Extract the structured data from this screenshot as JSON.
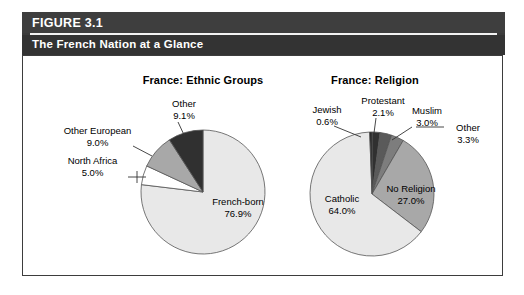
{
  "figure": {
    "number": "FIGURE 3.1",
    "subtitle": "The French Nation at a Glance"
  },
  "colors": {
    "header_bg": "#3b3b3b",
    "header_bg_bottom": "#333333",
    "header_text": "#ffffff",
    "border": "#3d3d3d",
    "slice_light": "#e8e8e8",
    "slice_white": "#ffffff",
    "slice_medium": "#a8a8a8",
    "slice_dark": "#303030",
    "slice_darker": "#1e1e1e",
    "slice_mid_dark": "#5a5a5a",
    "slice_mid": "#7d7d7d",
    "outline": "#555555"
  },
  "chart_data": [
    {
      "type": "pie",
      "title": "France: Ethnic Groups",
      "labels": [
        "French-born",
        "North Africa",
        "Other European",
        "Other"
      ],
      "values": [
        76.9,
        9.0,
        5.0,
        9.1
      ],
      "value_strings": [
        "76.9%",
        "5.0%",
        "9.0%",
        "9.1%"
      ],
      "slices": [
        {
          "label": "French-born",
          "value": 76.9,
          "value_str": "76.9%",
          "color": "#e8e8e8",
          "inside": true
        },
        {
          "label": "North Africa",
          "value": 5.0,
          "value_str": "5.0%",
          "color": "#ffffff",
          "inside": false
        },
        {
          "label": "Other European",
          "value": 9.0,
          "value_str": "9.0%",
          "color": "#a8a8a8",
          "inside": false
        },
        {
          "label": "Other",
          "value": 9.1,
          "value_str": "9.1%",
          "color": "#303030",
          "inside": false
        }
      ],
      "legend": "none",
      "grid": false
    },
    {
      "type": "pie",
      "title": "France: Religion",
      "labels": [
        "Catholic",
        "No Religion",
        "Other",
        "Muslim",
        "Protestant",
        "Jewish"
      ],
      "values": [
        64.0,
        27.0,
        3.3,
        3.0,
        2.1,
        0.6
      ],
      "value_strings": [
        "64.0%",
        "27.0%",
        "3.3%",
        "3.0%",
        "2.1%",
        "0.6%"
      ],
      "slices": [
        {
          "label": "Catholic",
          "value": 64.0,
          "value_str": "64.0%",
          "color": "#e8e8e8",
          "inside": true
        },
        {
          "label": "No Religion",
          "value": 27.0,
          "value_str": "27.0%",
          "color": "#a8a8a8",
          "inside": true
        },
        {
          "label": "Other",
          "value": 3.3,
          "value_str": "3.3%",
          "color": "#7d7d7d",
          "inside": false
        },
        {
          "label": "Muslim",
          "value": 3.0,
          "value_str": "3.0%",
          "color": "#5a5a5a",
          "inside": false
        },
        {
          "label": "Protestant",
          "value": 2.1,
          "value_str": "2.1%",
          "color": "#303030",
          "inside": false
        },
        {
          "label": "Jewish",
          "value": 0.6,
          "value_str": "0.6%",
          "color": "#1e1e1e",
          "inside": false
        }
      ],
      "legend": "none",
      "grid": false
    }
  ],
  "ethnic_labels": {
    "other": {
      "name": "Other",
      "value": "9.1%"
    },
    "other_european": {
      "name": "Other European",
      "value": "9.0%"
    },
    "north_africa": {
      "name": "North Africa",
      "value": "5.0%"
    },
    "french_born": {
      "name": "French-born",
      "value": "76.9%"
    }
  },
  "religion_labels": {
    "jewish": {
      "name": "Jewish",
      "value": "0.6%"
    },
    "protestant": {
      "name": "Protestant",
      "value": "2.1%"
    },
    "muslim": {
      "name": "Muslim",
      "value": "3.0%"
    },
    "other": {
      "name": "Other",
      "value": "3.3%"
    },
    "catholic": {
      "name": "Catholic",
      "value": "64.0%"
    },
    "no_religion": {
      "name": "No Religion",
      "value": "27.0%"
    }
  }
}
